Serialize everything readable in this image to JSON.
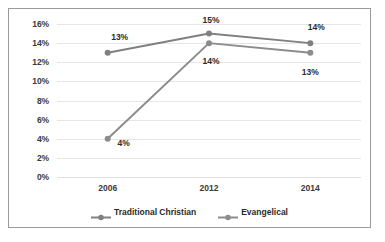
{
  "chart_data": {
    "type": "line",
    "title": "",
    "subtitle": "",
    "xlabel": "",
    "ylabel": "",
    "categories": [
      "2006",
      "2012",
      "2014"
    ],
    "ylim": [
      0,
      16
    ],
    "ytick_labels": [
      "0%",
      "2%",
      "4%",
      "6%",
      "8%",
      "10%",
      "12%",
      "14%",
      "16%"
    ],
    "ytick_values": [
      0,
      2,
      4,
      6,
      8,
      10,
      12,
      14,
      16
    ],
    "grid": true,
    "legend_position": "bottom",
    "series": [
      {
        "name": "Traditional Christian",
        "color": "#808080",
        "values": [
          13,
          15,
          14
        ],
        "labels": [
          "13%",
          "15%",
          "14%"
        ],
        "label_position": "above"
      },
      {
        "name": "Evangelical",
        "color": "#8c8c8c",
        "values": [
          4,
          14,
          13
        ],
        "labels": [
          "4%",
          "14%",
          "13%"
        ],
        "label_position": "below"
      }
    ]
  },
  "colors": {
    "frame_border": "#9a9a9a",
    "gridline": "#e6e6e6",
    "text": "#2b2b2b",
    "background": "#ffffff"
  }
}
